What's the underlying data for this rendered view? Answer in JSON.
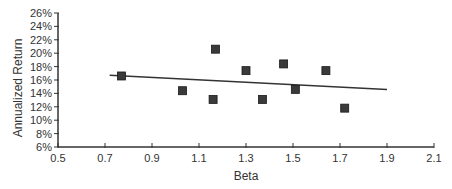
{
  "chart_data": {
    "type": "scatter",
    "title": "",
    "xlabel": "Beta",
    "ylabel": "Annualized Return",
    "xlim": [
      0.5,
      2.1
    ],
    "ylim": [
      6,
      26
    ],
    "x_ticks": [
      "0.5",
      "0.7",
      "0.9",
      "1.1",
      "1.3",
      "1.5",
      "1.7",
      "1.9",
      "2.1"
    ],
    "y_ticks": [
      "6%",
      "8%",
      "10%",
      "12%",
      "14%",
      "16%",
      "18%",
      "20%",
      "22%",
      "24%",
      "26%"
    ],
    "grid": false,
    "legend": null,
    "series": [
      {
        "name": "Funds",
        "marker": "square",
        "points": [
          {
            "x": 0.77,
            "y": 16.6
          },
          {
            "x": 1.03,
            "y": 14.4
          },
          {
            "x": 1.16,
            "y": 13.1
          },
          {
            "x": 1.17,
            "y": 20.6
          },
          {
            "x": 1.3,
            "y": 17.4
          },
          {
            "x": 1.37,
            "y": 13.1
          },
          {
            "x": 1.46,
            "y": 18.4
          },
          {
            "x": 1.51,
            "y": 14.6
          },
          {
            "x": 1.64,
            "y": 17.4
          },
          {
            "x": 1.72,
            "y": 11.8
          }
        ]
      }
    ],
    "trendline": {
      "type": "linear",
      "start": {
        "x": 0.72,
        "y": 16.7
      },
      "end": {
        "x": 1.9,
        "y": 14.6
      }
    }
  },
  "colors": {
    "marker": "#3a3a3a",
    "axis": "#333333",
    "trendline": "#333333"
  }
}
